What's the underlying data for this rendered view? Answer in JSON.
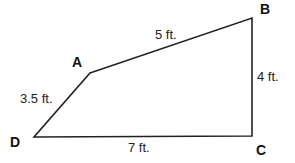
{
  "diagram": {
    "type": "quadrilateral",
    "stroke_color": "#222222",
    "vertices": [
      {
        "label": "A",
        "x": 90,
        "y": 73
      },
      {
        "label": "B",
        "x": 252,
        "y": 18
      },
      {
        "label": "C",
        "x": 252,
        "y": 136
      },
      {
        "label": "D",
        "x": 34,
        "y": 137
      }
    ],
    "edges": [
      {
        "from": "A",
        "to": "B",
        "length": "5 ft."
      },
      {
        "from": "B",
        "to": "C",
        "length": "4 ft."
      },
      {
        "from": "C",
        "to": "D",
        "length": "7 ft."
      },
      {
        "from": "D",
        "to": "A",
        "length": "3.5 ft."
      }
    ]
  }
}
